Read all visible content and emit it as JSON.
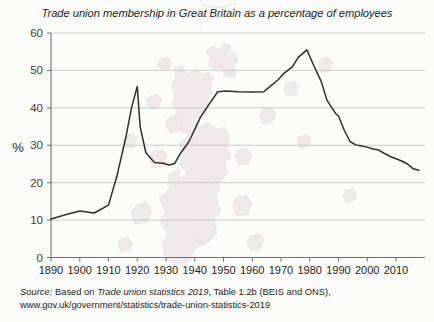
{
  "chart_data": {
    "type": "line",
    "title": "Trade union membership in Great Britain as a percentage of employees",
    "xlabel": "",
    "ylabel": "%",
    "xlim": [
      1890,
      2018
    ],
    "ylim": [
      0,
      60
    ],
    "ytick_labels": [
      "0",
      "10",
      "20",
      "30",
      "40",
      "50",
      "60"
    ],
    "ytick_values": [
      0,
      10,
      20,
      30,
      40,
      50,
      60
    ],
    "xtick_labels": [
      "1890",
      "1900",
      "1910",
      "1920",
      "1930",
      "1940",
      "1950",
      "1960",
      "1970",
      "1980",
      "1990",
      "2000",
      "2010"
    ],
    "xtick_values": [
      1890,
      1900,
      1910,
      1920,
      1930,
      1940,
      1950,
      1960,
      1970,
      1980,
      1990,
      2000,
      2010
    ],
    "grid": "horizontal",
    "legend": "none",
    "line_color": "#2f2f2f",
    "series": [
      {
        "name": "Trade union membership (% of employees)",
        "x": [
          1890,
          1895,
          1900,
          1905,
          1910,
          1913,
          1916,
          1918,
          1920,
          1921,
          1923,
          1926,
          1929,
          1931,
          1933,
          1935,
          1938,
          1942,
          1945,
          1948,
          1951,
          1955,
          1960,
          1964,
          1966,
          1969,
          1971,
          1974,
          1976,
          1979,
          1981,
          1984,
          1986,
          1989,
          1990,
          1992,
          1994,
          1996,
          1998,
          2000,
          2002,
          2004,
          2006,
          2008,
          2010,
          2012,
          2014,
          2016,
          2018
        ],
        "y": [
          10.3,
          11.4,
          12.4,
          11.9,
          14.0,
          22.0,
          32.0,
          40.0,
          45.7,
          35.0,
          28.0,
          25.4,
          25.2,
          24.7,
          25.1,
          27.8,
          31.0,
          37.5,
          41.0,
          44.3,
          44.5,
          44.3,
          44.2,
          44.3,
          45.6,
          47.5,
          49.2,
          51.0,
          53.5,
          55.5,
          52.0,
          47.0,
          42.0,
          38.5,
          37.8,
          34.0,
          31.0,
          30.1,
          29.8,
          29.5,
          29.0,
          28.7,
          27.8,
          27.0,
          26.4,
          25.8,
          25.0,
          23.7,
          23.3
        ]
      }
    ],
    "source": {
      "lead": "Source:",
      "prefix": "Based on",
      "work": "Trade union statistics 2019",
      "suffix": ", Table 1.2b (BEIS and ONS),",
      "url": "www.gov.uk/government/statistics/trade-union-statistics-2019"
    }
  }
}
